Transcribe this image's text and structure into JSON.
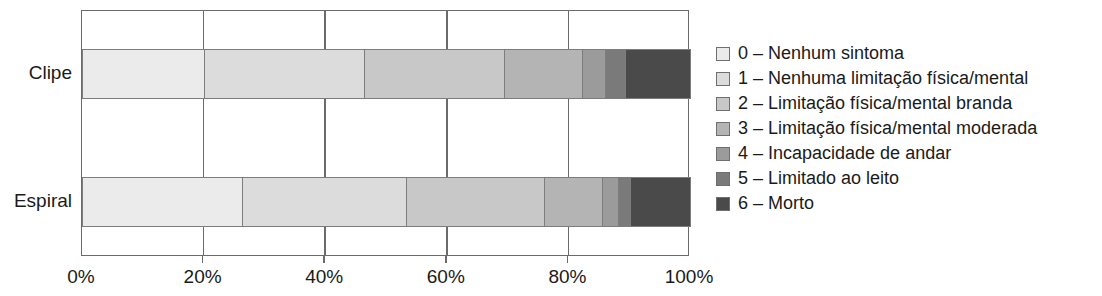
{
  "chart_data": {
    "type": "bar",
    "orientation": "horizontal",
    "stacked": true,
    "normalized_percent": true,
    "title": "",
    "subtitle": "",
    "xlabel": "",
    "ylabel": "",
    "xlim": [
      0,
      100
    ],
    "xticks": [
      0,
      20,
      40,
      60,
      80,
      100
    ],
    "xtick_labels": [
      "0%",
      "20%",
      "40%",
      "60%",
      "80%",
      "100%"
    ],
    "grid": true,
    "grid_axis": "x",
    "legend_position": "right",
    "categories": [
      "Clipe",
      "Espiral"
    ],
    "series": [
      {
        "name": "0 – Nenhum sintoma",
        "color": "#ebebeb",
        "values": [
          20.0,
          26.3
        ]
      },
      {
        "name": "1 – Nenhuma limitação física/mental",
        "color": "#dcdcdc",
        "values": [
          26.4,
          27.0
        ]
      },
      {
        "name": "2 – Limitação física/mental branda",
        "color": "#c8c8c8",
        "values": [
          23.0,
          22.7
        ]
      },
      {
        "name": "3 – Limitação física/mental moderada",
        "color": "#b4b4b4",
        "values": [
          12.8,
          9.5
        ]
      },
      {
        "name": "4 – Incapacidade de andar",
        "color": "#9b9b9b",
        "values": [
          3.8,
          2.6
        ]
      },
      {
        "name": "5 – Limitado ao leito",
        "color": "#7a7a7a",
        "values": [
          3.3,
          2.1
        ]
      },
      {
        "name": "6 – Morto",
        "color": "#4a4a4a",
        "values": [
          10.7,
          9.8
        ]
      }
    ],
    "cumulative_boundaries_percent": {
      "Clipe": [
        20.0,
        46.4,
        69.4,
        82.2,
        86.0,
        89.3,
        100.0
      ],
      "Espiral": [
        26.3,
        53.3,
        76.0,
        85.5,
        88.2,
        90.3,
        100.0
      ]
    }
  },
  "legend": {
    "items": [
      {
        "label": "0 – Nenhum sintoma"
      },
      {
        "label": "1 – Nenhuma limitação física/mental"
      },
      {
        "label": "2 – Limitação física/mental branda"
      },
      {
        "label": "3 – Limitação física/mental moderada"
      },
      {
        "label": "4 – Incapacidade de andar"
      },
      {
        "label": "5 – Limitado ao leito"
      },
      {
        "label": "6 – Morto"
      }
    ]
  }
}
